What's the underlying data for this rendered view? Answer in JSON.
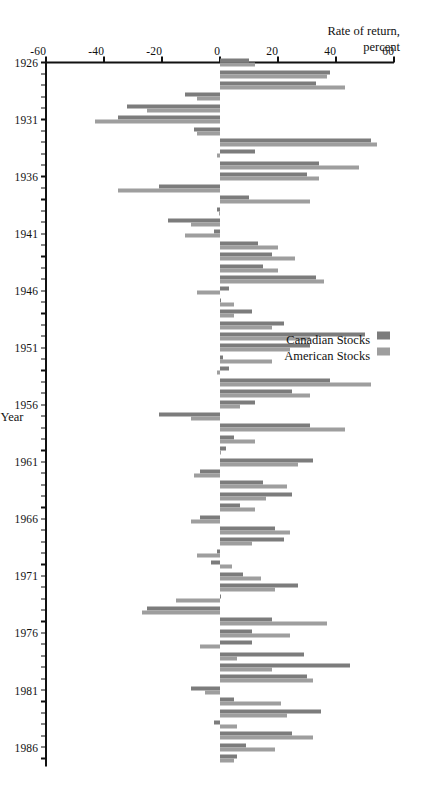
{
  "chart_data": {
    "type": "bar",
    "title": "",
    "subtitle": "",
    "orientation": "horizontal-rotated",
    "xlabel": "Rate of return,\npercent",
    "ylabel": "Year",
    "value_axis_label_line1": "Rate of return,",
    "value_axis_label_line2": "percent",
    "xlim": [
      -60,
      60
    ],
    "value_ticks": [
      60,
      40,
      20,
      0,
      -20,
      -40,
      -60
    ],
    "value_tick_labels": [
      "60",
      "40",
      "20",
      "0",
      "-20",
      "-40",
      "-60"
    ],
    "grid": false,
    "legend_position": "left",
    "legend": [
      "Canadian Stocks",
      "American Stocks"
    ],
    "colors": {
      "canadian": "#7c7c7c",
      "american": "#9e9e9e",
      "axis": "#111111",
      "background": "#ffffff"
    },
    "year_ticks": [
      1926,
      1931,
      1936,
      1941,
      1946,
      1951,
      1956,
      1961,
      1966,
      1971,
      1976,
      1981,
      1986
    ],
    "year_tick_labels": [
      "1926",
      "1931",
      "1936",
      "1941",
      "1946",
      "1951",
      "1956",
      "1961",
      "1966",
      "1971",
      "1976",
      "1981",
      "1986"
    ],
    "categories": [
      1926,
      1927,
      1928,
      1929,
      1930,
      1931,
      1932,
      1933,
      1934,
      1935,
      1936,
      1937,
      1938,
      1939,
      1940,
      1941,
      1942,
      1943,
      1944,
      1945,
      1946,
      1947,
      1948,
      1949,
      1950,
      1951,
      1952,
      1953,
      1954,
      1955,
      1956,
      1957,
      1958,
      1959,
      1960,
      1961,
      1962,
      1963,
      1964,
      1965,
      1966,
      1967,
      1968,
      1969,
      1970,
      1971,
      1972,
      1973,
      1974,
      1975,
      1976,
      1977,
      1978,
      1979,
      1980,
      1981,
      1982,
      1983,
      1984,
      1985,
      1986,
      1987
    ],
    "series": [
      {
        "name": "Canadian Stocks",
        "color": "#7c7c7c",
        "values": [
          10.0,
          38.0,
          33.0,
          -12.0,
          -32.0,
          -35.0,
          -9.0,
          52.0,
          12.0,
          34.0,
          30.0,
          -21.0,
          10.0,
          -1.0,
          -18.0,
          -2.0,
          13.0,
          18.0,
          15.0,
          33.0,
          3.0,
          0.5,
          11.0,
          22.0,
          50.0,
          31.0,
          1.0,
          3.0,
          38.0,
          25.0,
          12.0,
          -21.0,
          31.0,
          5.0,
          2.0,
          32.0,
          -7.0,
          15.0,
          25.0,
          7.0,
          -7.0,
          19.0,
          22.0,
          -1.0,
          -3.0,
          8.0,
          27.0,
          0.5,
          -25.0,
          18.0,
          11.0,
          11.0,
          29.0,
          45.0,
          30.0,
          -10.0,
          5.0,
          35.0,
          -2.0,
          25.0,
          9.0,
          6.0
        ]
      },
      {
        "name": "American Stocks",
        "color": "#9e9e9e",
        "values": [
          12.0,
          37.0,
          43.0,
          -8.0,
          -25.0,
          -43.0,
          -8.0,
          54.0,
          -1.0,
          48.0,
          34.0,
          -35.0,
          31.0,
          -0.5,
          -10.0,
          -12.0,
          20.0,
          26.0,
          20.0,
          36.0,
          -8.0,
          5.0,
          5.0,
          18.0,
          31.0,
          24.0,
          18.0,
          -1.0,
          52.0,
          31.0,
          7.0,
          -10.0,
          43.0,
          12.0,
          0.5,
          27.0,
          -9.0,
          23.0,
          16.0,
          12.0,
          -10.0,
          24.0,
          11.0,
          -8.0,
          4.0,
          14.0,
          19.0,
          -15.0,
          -27.0,
          37.0,
          24.0,
          -7.0,
          6.0,
          18.0,
          32.0,
          -5.0,
          21.0,
          23.0,
          6.0,
          32.0,
          19.0,
          5.0
        ]
      }
    ]
  }
}
